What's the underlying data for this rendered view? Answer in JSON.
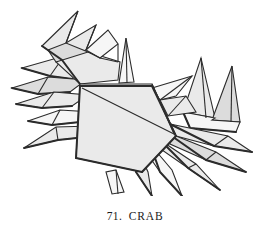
{
  "figure": {
    "caption_number": "71.",
    "caption_title": "CRAB",
    "caption_full": "71. CRAB",
    "style": "line-art shaded polygon illustration",
    "background_color": "#ffffff",
    "panel_fill_light": "#eaeaea",
    "panel_fill_mid": "#d9d9d9",
    "panel_fill_dark": "#c4c4c4",
    "panel_fill_white": "#f7f7f7",
    "stroke_color": "#2b2b2b",
    "shadow_color": "#3a3a3a"
  },
  "diagram_parts": {
    "body": "central pentagon carapace with diagonal crease",
    "left_claw": "upper-left zigzag pincer",
    "right_claw": "upper-right twin spike pincer",
    "eye_spike": "thin vertical spike above carapace",
    "left_legs": "three layered pointed legs to the left",
    "right_legs": "fan of four pointed legs lower right",
    "lower_legs": "two pointed legs below body"
  }
}
